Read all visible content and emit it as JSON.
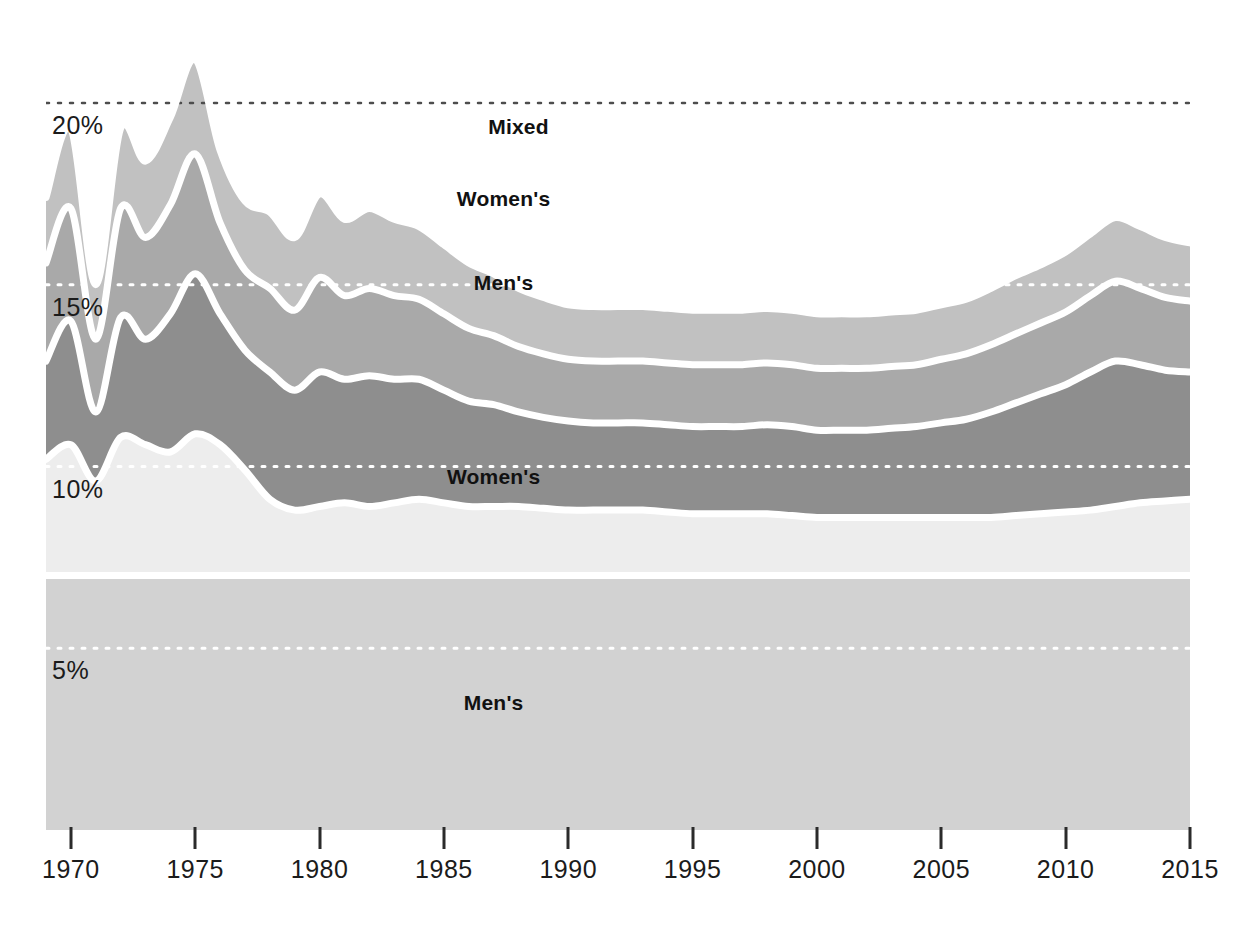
{
  "chart_data": {
    "type": "area",
    "title": "",
    "subtitle": "",
    "xlabel": "",
    "ylabel": "",
    "stacked": true,
    "grid": "horizontal dotted",
    "legend": "inline labels on bands",
    "xlim": [
      1969,
      2015
    ],
    "ylim": [
      0,
      22.5
    ],
    "y_ticks": [
      5,
      10,
      15,
      20
    ],
    "y_tick_labels": [
      "5%",
      "10%",
      "15%",
      "20%"
    ],
    "x_ticks": [
      1970,
      1975,
      1980,
      1985,
      1990,
      1995,
      2000,
      2005,
      2010,
      2015
    ],
    "x_tick_labels": [
      "1970",
      "1975",
      "1980",
      "1985",
      "1990",
      "1995",
      "2000",
      "2005",
      "2010",
      "2015"
    ],
    "band_labels": [
      {
        "text": "Mixed",
        "x": 1988.0,
        "y": 19.35
      },
      {
        "text": "Women's",
        "x": 1987.4,
        "y": 17.35
      },
      {
        "text": "Men's",
        "x": 1987.4,
        "y": 15.05
      },
      {
        "text": "Women's",
        "x": 1987.0,
        "y": 9.7
      },
      {
        "text": "Men's",
        "x": 1987.0,
        "y": 3.5
      }
    ],
    "colors": {
      "series_mens_bottom": "#d2d2d2",
      "series_womens_low": "#ededed",
      "series_mens_mid": "#8e8e8e",
      "series_womens_high": "#a9a9a9",
      "series_mixed_top": "#c1c1c1",
      "separator": "#ffffff",
      "gridline_dark": "#4d4d4d",
      "gridline_light": "#ffffff",
      "axis_text": "#1b1b1b",
      "background": "#ffffff"
    },
    "x": [
      1969,
      1970,
      1971,
      1972,
      1973,
      1974,
      1975,
      1976,
      1977,
      1978,
      1979,
      1980,
      1981,
      1982,
      1983,
      1984,
      1985,
      1986,
      1987,
      1988,
      1989,
      1990,
      1991,
      1992,
      1993,
      1994,
      1995,
      1996,
      1997,
      1998,
      1999,
      2000,
      2001,
      2002,
      2003,
      2004,
      2005,
      2006,
      2007,
      2008,
      2009,
      2010,
      2011,
      2012,
      2013,
      2014,
      2015
    ],
    "series": [
      {
        "name": "Men's",
        "position": "bottom",
        "color": "#d2d2d2",
        "values": [
          7.0,
          7.0,
          7.0,
          7.0,
          7.0,
          7.0,
          7.0,
          7.0,
          7.0,
          7.0,
          7.0,
          7.0,
          7.0,
          7.0,
          7.0,
          7.0,
          7.0,
          7.0,
          7.0,
          7.0,
          7.0,
          7.0,
          7.0,
          7.0,
          7.0,
          7.0,
          7.0,
          7.0,
          7.0,
          7.0,
          7.0,
          7.0,
          7.0,
          7.0,
          7.0,
          7.0,
          7.0,
          7.0,
          7.0,
          7.0,
          7.0,
          7.0,
          7.0,
          7.0,
          7.0,
          7.0,
          7.0
        ]
      },
      {
        "name": "Women's",
        "position": "lower",
        "color": "#ededed",
        "values": [
          3.2,
          3.6,
          2.6,
          3.8,
          3.6,
          3.4,
          3.9,
          3.6,
          2.9,
          2.1,
          1.8,
          1.9,
          2.0,
          1.9,
          2.0,
          2.1,
          2.0,
          1.9,
          1.9,
          1.9,
          1.85,
          1.8,
          1.8,
          1.8,
          1.8,
          1.75,
          1.7,
          1.7,
          1.7,
          1.7,
          1.65,
          1.6,
          1.6,
          1.6,
          1.6,
          1.6,
          1.6,
          1.6,
          1.6,
          1.65,
          1.7,
          1.75,
          1.8,
          1.9,
          2.0,
          2.05,
          2.1
        ]
      },
      {
        "name": "Men's",
        "position": "middle",
        "color": "#8e8e8e",
        "values": [
          2.7,
          3.4,
          1.9,
          3.3,
          2.9,
          3.8,
          4.4,
          3.6,
          3.3,
          3.5,
          3.3,
          3.7,
          3.4,
          3.6,
          3.4,
          3.3,
          3.1,
          2.9,
          2.8,
          2.6,
          2.5,
          2.45,
          2.4,
          2.4,
          2.4,
          2.4,
          2.4,
          2.4,
          2.4,
          2.45,
          2.45,
          2.4,
          2.4,
          2.4,
          2.45,
          2.5,
          2.6,
          2.7,
          2.9,
          3.1,
          3.3,
          3.5,
          3.8,
          4.0,
          3.8,
          3.6,
          3.5
        ]
      },
      {
        "name": "Women's",
        "position": "upper",
        "color": "#a9a9a9",
        "values": [
          2.7,
          3.1,
          2.0,
          3.0,
          2.8,
          3.0,
          3.3,
          2.5,
          2.2,
          2.3,
          2.2,
          2.6,
          2.3,
          2.4,
          2.3,
          2.2,
          2.1,
          2.0,
          1.9,
          1.8,
          1.75,
          1.7,
          1.7,
          1.7,
          1.7,
          1.7,
          1.7,
          1.7,
          1.7,
          1.7,
          1.7,
          1.7,
          1.7,
          1.7,
          1.7,
          1.7,
          1.75,
          1.8,
          1.85,
          1.9,
          1.95,
          2.0,
          2.1,
          2.2,
          2.1,
          2.0,
          1.95
        ]
      },
      {
        "name": "Mixed",
        "position": "top",
        "color": "#c1c1c1",
        "values": [
          1.8,
          2.2,
          1.5,
          2.2,
          2.1,
          2.4,
          2.6,
          2.0,
          1.9,
          2.1,
          2.0,
          2.3,
          2.1,
          2.2,
          2.1,
          2.0,
          1.9,
          1.8,
          1.7,
          1.6,
          1.55,
          1.5,
          1.5,
          1.5,
          1.5,
          1.5,
          1.5,
          1.5,
          1.5,
          1.5,
          1.5,
          1.5,
          1.5,
          1.5,
          1.5,
          1.5,
          1.5,
          1.5,
          1.55,
          1.6,
          1.6,
          1.65,
          1.7,
          1.75,
          1.7,
          1.65,
          1.6
        ]
      }
    ]
  }
}
